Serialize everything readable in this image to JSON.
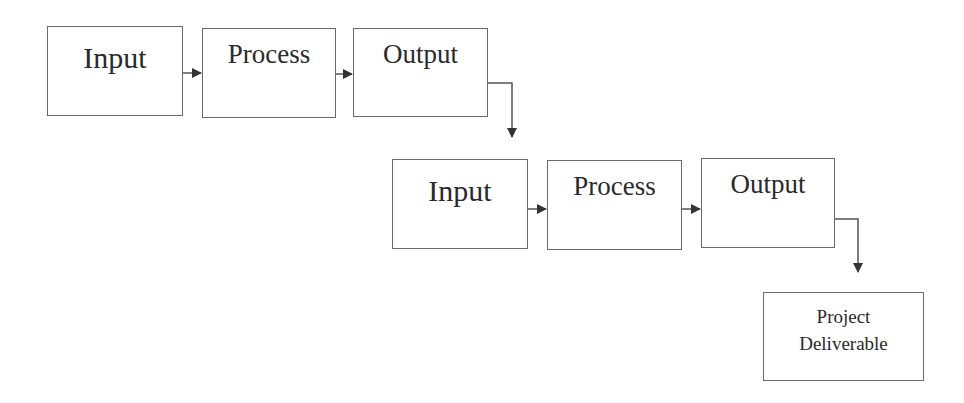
{
  "diagram": {
    "type": "flowchart",
    "row1": {
      "input": "Input",
      "process": "Process",
      "output": "Output"
    },
    "row2": {
      "input": "Input",
      "process": "Process",
      "output": "Output"
    },
    "final": {
      "line1": "Project",
      "line2": "Deliverable"
    },
    "colors": {
      "stroke": "#6a6a6a",
      "arrow": "#333333",
      "text": "#2a2a2a",
      "background": "#ffffff"
    }
  }
}
